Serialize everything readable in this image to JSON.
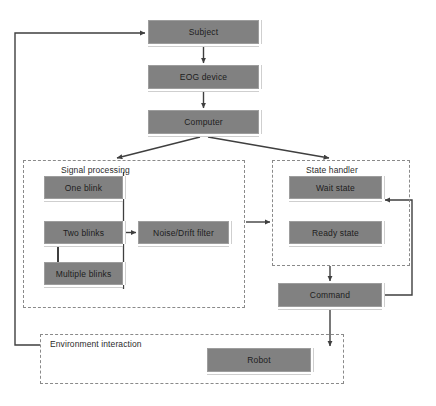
{
  "diagram": {
    "type": "flowchart",
    "colors": {
      "node_fill": "#818181",
      "node_border": "#9d9d9d",
      "node_text": "#1d1d1d",
      "group_border": "#8a8a8a",
      "edge": "#3f3f3f",
      "background": "#ffffff"
    }
  },
  "nodes": {
    "subject": {
      "label": "Subject",
      "x": 148,
      "y": 20,
      "w": 111,
      "h": 24
    },
    "eog_device": {
      "label": "EOG device",
      "x": 148,
      "y": 65,
      "w": 111,
      "h": 24
    },
    "computer": {
      "label": "Computer",
      "x": 148,
      "y": 110,
      "w": 111,
      "h": 24
    },
    "one_blink": {
      "label": "One blink",
      "x": 44,
      "y": 176,
      "w": 79,
      "h": 23
    },
    "two_blinks": {
      "label": "Two blinks",
      "x": 44,
      "y": 221,
      "w": 79,
      "h": 23
    },
    "multiple_blinks": {
      "label": "Multiple blinks",
      "x": 44,
      "y": 262,
      "w": 79,
      "h": 23
    },
    "noise_drift_filter": {
      "label": "Noise/Drift filter",
      "x": 138,
      "y": 221,
      "w": 91,
      "h": 23
    },
    "wait_state": {
      "label": "Wait state",
      "x": 289,
      "y": 176,
      "w": 93,
      "h": 23
    },
    "ready_state": {
      "label": "Ready state",
      "x": 289,
      "y": 221,
      "w": 93,
      "h": 23
    },
    "command": {
      "label": "Command",
      "x": 278,
      "y": 283,
      "w": 104,
      "h": 24
    },
    "robot": {
      "label": "Robot",
      "x": 207,
      "y": 348,
      "w": 104,
      "h": 24
    }
  },
  "groups": {
    "signal_processing": {
      "label": "Signal processing",
      "x": 23,
      "y": 160,
      "w": 222,
      "h": 148,
      "label_x": 61,
      "label_y": 165
    },
    "state_handler": {
      "label": "State handler",
      "x": 272,
      "y": 160,
      "w": 138,
      "h": 106,
      "label_x": 306,
      "label_y": 165
    },
    "environment_interaction": {
      "label": "Environment interaction",
      "x": 40,
      "y": 334,
      "w": 304,
      "h": 50,
      "label_x": 50,
      "label_y": 339
    }
  }
}
